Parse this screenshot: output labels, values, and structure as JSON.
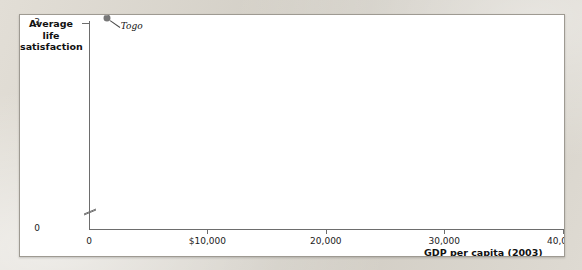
{
  "chart_data": {
    "type": "scatter",
    "title": "",
    "xlabel": "GDP per capita (2003)",
    "ylabel": "Average life satisfaction",
    "ylabel_lines": [
      "Average",
      "life",
      "satisfaction"
    ],
    "xlim": [
      0,
      42000
    ],
    "ylim": [
      2.6,
      8.4
    ],
    "y_axis_broken": true,
    "grid": false,
    "legend": null,
    "xticks": [
      0,
      10000,
      20000,
      30000,
      40000
    ],
    "xtick_labels": [
      "0",
      "$10,000",
      "20,000",
      "30,000",
      "40,000"
    ],
    "yticks": [
      0,
      3,
      4,
      5,
      6,
      7,
      8
    ],
    "ytick_labels": [
      "0",
      "3",
      "4",
      "5",
      "6",
      "7",
      "8"
    ],
    "points": [
      {
        "name": "Togo",
        "x": 1500,
        "y": 3.15,
        "shade": "mid",
        "label_dx": 14,
        "label_dy": 9,
        "anchor": "left"
      },
      {
        "name": "Benin",
        "x": 1400,
        "y": 3.35,
        "shade": "light",
        "label_dx": 16,
        "label_dy": 0,
        "anchor": "left"
      },
      {
        "name": "Chad",
        "x": 1100,
        "y": 3.6,
        "shade": "light",
        "label_dx": -5,
        "label_dy": -10,
        "anchor": "right"
      },
      {
        "name": "Georgia",
        "x": 4400,
        "y": 3.78,
        "shade": "mid",
        "label_dx": -2,
        "label_dy": -10,
        "anchor": "right"
      },
      {
        "name": "Bulgaria",
        "x": 8600,
        "y": 3.8,
        "shade": "mid",
        "label_dx": 15,
        "label_dy": 4,
        "anchor": "left"
      },
      {
        "name": "China",
        "x": 5200,
        "y": 4.6,
        "shade": "light",
        "label_dx": 15,
        "label_dy": 0,
        "anchor": "left"
      },
      {
        "name": "Russia",
        "x": 11800,
        "y": 4.95,
        "shade": "mid",
        "label_dx": -4,
        "label_dy": -14,
        "anchor": "right"
      },
      {
        "name": "India",
        "x": 3100,
        "y": 5.3,
        "shade": "dark",
        "label_dx": -6,
        "label_dy": -11,
        "anchor": "right"
      },
      {
        "name": "Puerto Rico",
        "x": 17300,
        "y": 5.2,
        "shade": "light",
        "label_dx": 10,
        "label_dy": 9,
        "anchor": "left"
      },
      {
        "name": "Hong Kong",
        "x": 27500,
        "y": 5.25,
        "shade": "dark",
        "label_dx": 16,
        "label_dy": 2,
        "anchor": "left"
      },
      {
        "name": "South Korea",
        "x": 17000,
        "y": 5.55,
        "shade": "light",
        "label_dx": 11,
        "label_dy": 2,
        "anchor": "left"
      },
      {
        "name": "Kuwait",
        "x": 26200,
        "y": 5.9,
        "shade": "dark",
        "label_dx": 15,
        "label_dy": 4,
        "anchor": "left"
      },
      {
        "name": "Taiwan",
        "x": 19800,
        "y": 6.1,
        "shade": "mid",
        "label_dx": 12,
        "label_dy": 6,
        "anchor": "left"
      },
      {
        "name": "Pakistan",
        "x": 2100,
        "y": 6.05,
        "shade": "light",
        "label_dx": -5,
        "label_dy": -11,
        "anchor": "right"
      },
      {
        "name": "Greece",
        "x": 15700,
        "y": 5.95,
        "shade": "dark",
        "label_dx": -8,
        "label_dy": 2,
        "anchor": "right"
      },
      {
        "name": "Singapore",
        "x": 26800,
        "y": 6.3,
        "shade": "light",
        "label_dx": 14,
        "label_dy": 3,
        "anchor": "left"
      },
      {
        "name": "United Arab Emirates",
        "x": 35400,
        "y": 6.55,
        "shade": "light",
        "label_dx": 16,
        "label_dy": 6,
        "anchor": "left",
        "lines": [
          "United Arab",
          "Emirates"
        ]
      },
      {
        "name": "Argentina",
        "x": 10200,
        "y": 6.25,
        "shade": "mid",
        "label_dx": -7,
        "label_dy": 9,
        "anchor": "right"
      },
      {
        "name": "Czech Rep.",
        "x": 14600,
        "y": 6.45,
        "shade": "mid",
        "label_dx": 13,
        "label_dy": -3,
        "anchor": "left",
        "lines": [
          "Czech",
          "Rep."
        ]
      },
      {
        "name": "Japan",
        "x": 24000,
        "y": 6.5,
        "shade": "dark",
        "label_dx": 9,
        "label_dy": -8,
        "anchor": "left"
      },
      {
        "name": "Mexico",
        "x": 7900,
        "y": 6.55,
        "shade": "light",
        "label_dx": 15,
        "label_dy": 0,
        "anchor": "left"
      },
      {
        "name": "Italy",
        "x": 23000,
        "y": 6.85,
        "shade": "light",
        "label_dx": -10,
        "label_dy": 2,
        "anchor": "right"
      },
      {
        "name": "Brazil",
        "x": 7100,
        "y": 6.68,
        "shade": "mid",
        "label_dx": -6,
        "label_dy": -8,
        "anchor": "right"
      },
      {
        "name": "Spain",
        "x": 20500,
        "y": 7.05,
        "shade": "mid",
        "label_dx": 14,
        "label_dy": -5,
        "anchor": "left"
      },
      {
        "name": "Saudi Arabia",
        "x": 15800,
        "y": 7.05,
        "shade": "dark",
        "label_dx": 0,
        "label_dy": -13,
        "anchor": "center"
      },
      {
        "name": "Costa Rica",
        "x": 8700,
        "y": 7.1,
        "shade": "mid",
        "label_dx": 15,
        "label_dy": 0,
        "anchor": "left"
      },
      {
        "name": "United Kingdom",
        "x": 25800,
        "y": 7.1,
        "shade": "dark",
        "label_dx": 16,
        "label_dy": -2,
        "anchor": "left"
      },
      {
        "name": "United States",
        "x": 35000,
        "y": 7.1,
        "shade": "dark",
        "label_dx": 15,
        "label_dy": 0,
        "anchor": "left"
      },
      {
        "name": "Venezuela",
        "x": 6400,
        "y": 7.2,
        "shade": "light",
        "label_dx": -8,
        "label_dy": -8,
        "anchor": "right"
      },
      {
        "name": "Norway",
        "x": 33800,
        "y": 7.5,
        "shade": "light",
        "label_dx": 3,
        "label_dy": -12,
        "anchor": "left"
      },
      {
        "name": "Finland",
        "x": 23900,
        "y": 7.65,
        "shade": "dark",
        "label_dx": -2,
        "label_dy": -13,
        "anchor": "center"
      },
      {
        "name": "Denmark",
        "x": 28000,
        "y": 7.85,
        "shade": "mid",
        "label_dx": 15,
        "label_dy": -2,
        "anchor": "left"
      }
    ]
  }
}
